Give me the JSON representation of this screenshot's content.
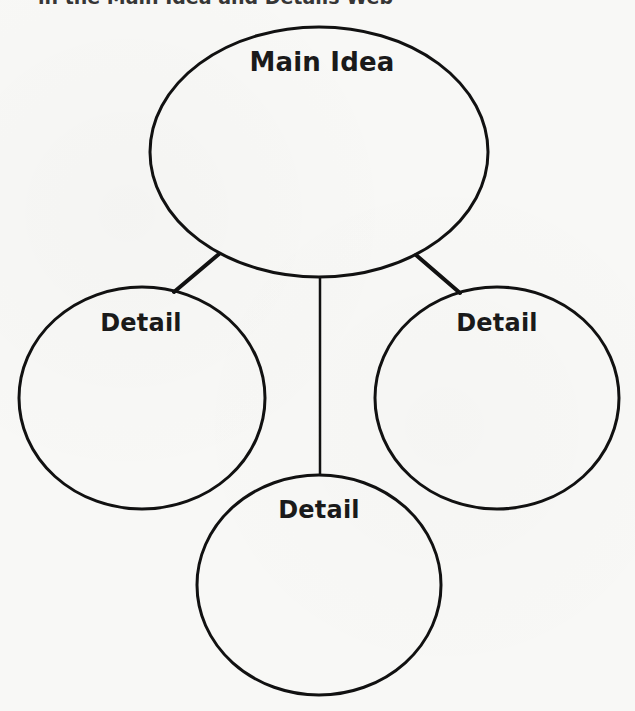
{
  "heading": {
    "text": "in the Main Idea and Details Web"
  },
  "diagram": {
    "type": "main-idea-details-web",
    "stroke_color": "#111111",
    "background_color": "#f8f8f6",
    "main": {
      "label": "Main Idea",
      "shape": "ellipse",
      "cx": 319,
      "cy": 152,
      "rx": 169,
      "ry": 125
    },
    "details": [
      {
        "id": "left",
        "label": "Detail",
        "cx": 142,
        "cy": 398,
        "rx": 123,
        "ry": 111
      },
      {
        "id": "right",
        "label": "Detail",
        "cx": 497,
        "cy": 398,
        "rx": 122,
        "ry": 111
      },
      {
        "id": "bottom",
        "label": "Detail",
        "cx": 319,
        "cy": 585,
        "rx": 122,
        "ry": 110
      }
    ],
    "connectors": [
      {
        "from": "main",
        "to": "left",
        "x1": 219,
        "y1": 254,
        "x2": 174,
        "y2": 292
      },
      {
        "from": "main",
        "to": "right",
        "x1": 416,
        "y1": 255,
        "x2": 460,
        "y2": 293
      },
      {
        "from": "main",
        "to": "bottom",
        "x1": 320,
        "y1": 277,
        "x2": 320,
        "y2": 475
      }
    ]
  }
}
